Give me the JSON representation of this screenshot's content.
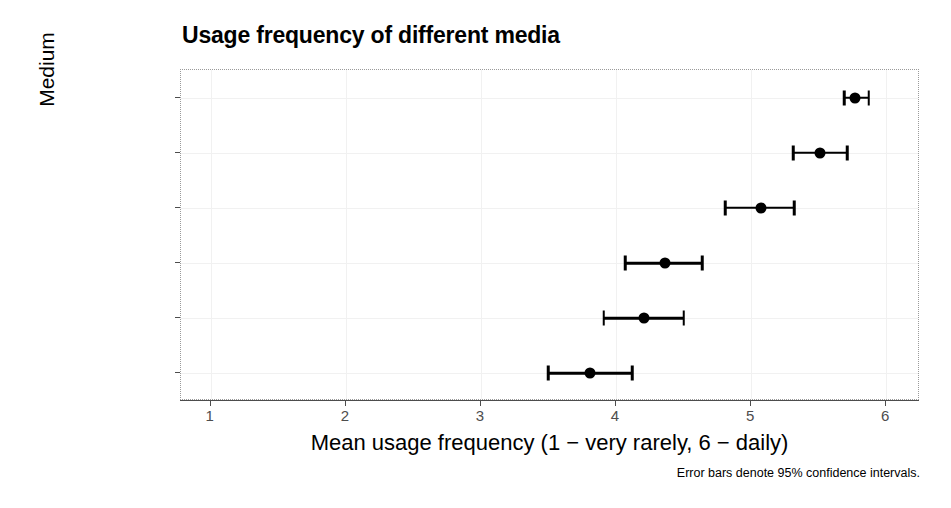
{
  "chart_data": {
    "type": "scatter",
    "title": "Usage frequency of different media",
    "xlabel": "Mean usage frequency (1 − very rarely, 6 − daily)",
    "ylabel": "Medium",
    "caption": "Error bars denote 95% confidence intervals.",
    "orientation": "horizontal",
    "grid": true,
    "legend": "none",
    "xlim": [
      0.78,
      6.25
    ],
    "xticks": [
      1,
      2,
      3,
      4,
      5,
      6
    ],
    "xtick_labels": [
      "1",
      "2",
      "3",
      "4",
      "5",
      "6"
    ],
    "categories": [
      "internet",
      "socialmedia",
      "facebook",
      "tv",
      "radio",
      "newspaper"
    ],
    "values": [
      5.77,
      5.51,
      5.07,
      4.36,
      4.21,
      3.81
    ],
    "ci_low": [
      5.69,
      5.31,
      4.81,
      4.07,
      3.91,
      3.5
    ],
    "ci_high": [
      5.87,
      5.71,
      5.32,
      4.64,
      4.5,
      4.12
    ],
    "point_color": "#000000",
    "grid_color": "#f1f1f1",
    "panel_border_color": "#9a9a9a",
    "points": [
      {
        "category": "internet",
        "mean": 5.77,
        "ci_low": 5.69,
        "ci_high": 5.87
      },
      {
        "category": "socialmedia",
        "mean": 5.51,
        "ci_low": 5.31,
        "ci_high": 5.71
      },
      {
        "category": "facebook",
        "mean": 5.07,
        "ci_low": 4.81,
        "ci_high": 5.32
      },
      {
        "category": "tv",
        "mean": 4.36,
        "ci_low": 4.07,
        "ci_high": 4.64
      },
      {
        "category": "radio",
        "mean": 4.21,
        "ci_low": 3.91,
        "ci_high": 4.5
      },
      {
        "category": "newspaper",
        "mean": 3.81,
        "ci_low": 3.5,
        "ci_high": 4.12
      }
    ]
  }
}
